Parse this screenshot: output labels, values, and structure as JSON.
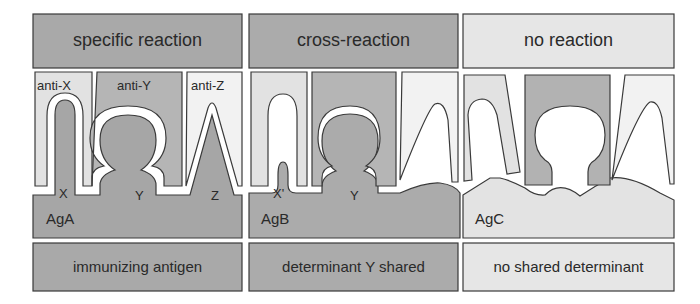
{
  "colors": {
    "dark_gray": "#a8a8a8",
    "mid_gray": "#bdbdbd",
    "light_gray": "#e4e4e4",
    "lightest": "#f0f0f0",
    "white": "#ffffff",
    "outline": "#3a3a3a"
  },
  "panels": [
    {
      "header": "specific reaction",
      "antibodies": [
        "anti-X",
        "anti-Y",
        "anti-Z"
      ],
      "determinants": [
        "X",
        "Y",
        "Z"
      ],
      "antigen": "AgA",
      "footer": "immunizing antigen"
    },
    {
      "header": "cross-reaction",
      "antibodies": [],
      "determinants": [
        "X'",
        "Y"
      ],
      "antigen": "AgB",
      "footer": "determinant Y shared"
    },
    {
      "header": "no reaction",
      "antibodies": [],
      "determinants": [],
      "antigen": "AgC",
      "footer": "no shared determinant"
    }
  ]
}
